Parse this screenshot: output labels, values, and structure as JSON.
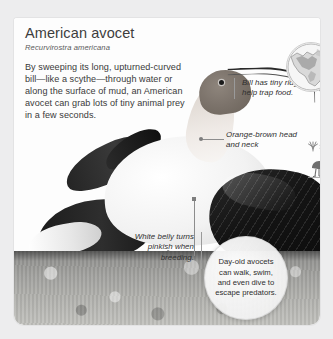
{
  "card": {
    "title": "American avocet",
    "scientific_name": "Recurvirostra americana",
    "body_text": "By sweeping its long, upturned-curved bill—like a scythe—through water or along the surface of mud, an American avocet can grab lots of tiny animal prey in a few seconds."
  },
  "callouts": {
    "bill": "Bill has tiny ridges that help trap food.",
    "head_neck": "Orange-brown head and neck",
    "belly": "White belly turns pinkish when breeding.",
    "chicks": "Day-old avocets can walk, swim, and even dive to escape predators."
  },
  "icons": {
    "range_map": "range-map-icon",
    "habitat": "habitat-wading-bird-icon"
  },
  "colors": {
    "page_background": "#ededee",
    "card_background": "#ffffff",
    "title_text": "#3d3d3d",
    "body_text": "#3a3a3a",
    "callout_text": "#2f2f2f",
    "leader_line": "#8d8d8d",
    "ground": "#a5a5a2",
    "wing_dark": "#141414"
  }
}
